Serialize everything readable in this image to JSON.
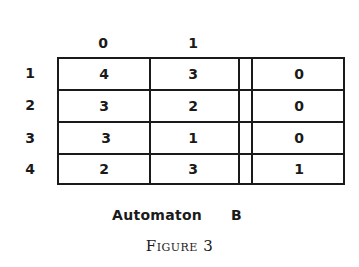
{
  "figure": {
    "column_headers": [
      "0",
      "1"
    ],
    "row_headers": [
      "1",
      "2",
      "3",
      "4"
    ],
    "rows": [
      {
        "state": "1",
        "next_on_0": "4",
        "next_on_1": "3",
        "output": "0"
      },
      {
        "state": "2",
        "next_on_0": "3",
        "next_on_1": "2",
        "output": "0"
      },
      {
        "state": "3",
        "next_on_0": "3",
        "next_on_1": "1",
        "output": "0"
      },
      {
        "state": "4",
        "next_on_0": "2",
        "next_on_1": "3",
        "output": "1"
      }
    ],
    "automaton_label": "Automaton",
    "automaton_name": "B",
    "caption": "Figure 3"
  }
}
